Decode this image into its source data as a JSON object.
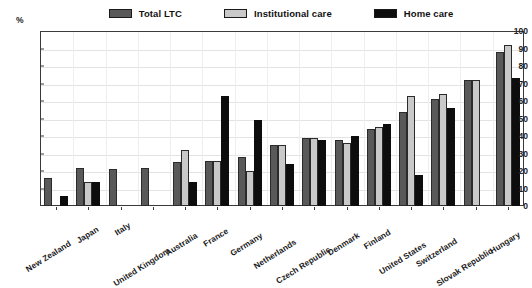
{
  "chart_data": {
    "type": "bar",
    "title": "",
    "xlabel": "",
    "ylabel": "%",
    "ylim": [
      0,
      100
    ],
    "ytick_step": 10,
    "yticks": [
      0,
      10,
      20,
      30,
      40,
      50,
      60,
      70,
      80,
      90,
      100
    ],
    "grid": true,
    "legend_position": "top",
    "categories": [
      "New Zealand",
      "Japan",
      "Italy",
      "United Kingdom",
      "Australia",
      "France",
      "Germany",
      "Netherlands",
      "Czech Republic",
      "Denmark",
      "Finland",
      "United States",
      "Switzerland",
      "Slovak Republic",
      "Hungary"
    ],
    "series": [
      {
        "name": "Total LTC",
        "color": "#595959",
        "values": [
          16,
          22,
          21,
          22,
          25,
          26,
          28,
          35,
          39,
          38,
          44,
          54,
          61,
          72,
          88
        ]
      },
      {
        "name": "Institutional care",
        "color": "#c9c9c9",
        "values": [
          null,
          14,
          null,
          null,
          32,
          26,
          20,
          35,
          39,
          36,
          45,
          63,
          64,
          72,
          92
        ]
      },
      {
        "name": "Home care",
        "color": "#0d0d0d",
        "values": [
          6,
          14,
          null,
          null,
          14,
          63,
          49,
          24,
          38,
          40,
          47,
          18,
          56,
          null,
          73
        ]
      }
    ]
  },
  "legend": {
    "items": [
      {
        "label": "Total LTC",
        "swatch": "total"
      },
      {
        "label": "Institutional care",
        "swatch": "institutional"
      },
      {
        "label": "Home care",
        "swatch": "home"
      }
    ]
  },
  "axes": {
    "y_unit_label": "%"
  }
}
